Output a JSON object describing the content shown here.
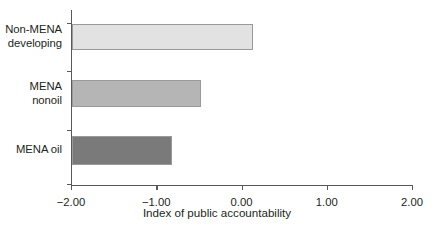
{
  "chart_data": {
    "type": "bar",
    "orientation": "horizontal",
    "title": "",
    "xlabel": "Index of public accountability",
    "ylabel": "",
    "categories": [
      "Non-MENA\ndeveloping",
      "MENA\nnonoil",
      "MENA oil"
    ],
    "values": [
      0.13,
      -0.48,
      -0.82
    ],
    "xlim": [
      -2.0,
      2.0
    ],
    "xticks": [
      -2.0,
      -1.0,
      0.0,
      1.0,
      2.0
    ],
    "xticklabels": [
      "−2.00",
      "−1.00",
      "0.00",
      "1.00",
      "2.00"
    ],
    "grid": false,
    "legend": false,
    "bar_colors": [
      "#e2e2e2",
      "#b5b5b5",
      "#7a7a7a"
    ],
    "bar_border_color": "#9a9a9a",
    "axis_color": "#58595b",
    "text_color": "#231f20",
    "baseline_value": -2.0,
    "note": "Bars are drawn from the left axis (−2.00) rightward to each value."
  }
}
